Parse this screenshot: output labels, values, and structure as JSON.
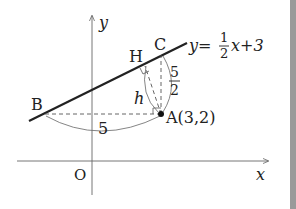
{
  "diagram": {
    "axes": {
      "x_label": "x",
      "y_label": "y",
      "origin_label": "O"
    },
    "line": {
      "equation_prefix": "y=",
      "fraction_numerator": "1",
      "fraction_denominator": "2",
      "equation_suffix": "x+3"
    },
    "points": {
      "A": {
        "label": "A(3,2)"
      },
      "B": {
        "label": "B"
      },
      "C": {
        "label": "C"
      },
      "H": {
        "label": "H"
      }
    },
    "measurements": {
      "horizontal_BA": "5",
      "vertical_AC_numerator": "5",
      "vertical_AC_denominator": "2",
      "perpendicular_AH": "h"
    },
    "colors": {
      "line": "#222222",
      "axis": "#555555",
      "dashed": "#555555",
      "edge_bar": "#9a9a9a"
    }
  }
}
